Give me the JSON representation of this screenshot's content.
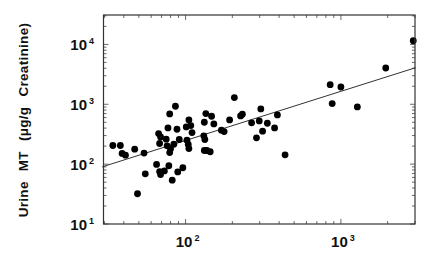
{
  "chart_data": {
    "type": "scatter",
    "title": "",
    "xlabel": "",
    "ylabel": "Urine MT (μg/g Creatinine)",
    "xscale": "log",
    "yscale": "log",
    "xlim": [
      29.6,
      3000
    ],
    "ylim": [
      10,
      31000
    ],
    "grid": false,
    "legend": null,
    "x_ticks": [
      {
        "value": 100,
        "base": "10",
        "exp": "2"
      },
      {
        "value": 1000,
        "base": "10",
        "exp": "3"
      }
    ],
    "y_ticks": [
      {
        "value": 10,
        "base": "10",
        "exp": "1"
      },
      {
        "value": 100,
        "base": "10",
        "exp": "2"
      },
      {
        "value": 1000,
        "base": "10",
        "exp": "3"
      },
      {
        "value": 10000,
        "base": "10",
        "exp": "4"
      }
    ],
    "series": [
      {
        "name": "data",
        "marker": "filled-circle",
        "color": "#000000",
        "points": [
          [
            34,
            205
          ],
          [
            38,
            205
          ],
          [
            39,
            151
          ],
          [
            41,
            141
          ],
          [
            47,
            178
          ],
          [
            49,
            32
          ],
          [
            54,
            153
          ],
          [
            55,
            69
          ],
          [
            65,
            99
          ],
          [
            67,
            324
          ],
          [
            69,
            285
          ],
          [
            68,
            221
          ],
          [
            68,
            75
          ],
          [
            69,
            67
          ],
          [
            73,
            77
          ],
          [
            75,
            261
          ],
          [
            77,
            403
          ],
          [
            76,
            202
          ],
          [
            78,
            94
          ],
          [
            79,
            690
          ],
          [
            80,
            180
          ],
          [
            79,
            156
          ],
          [
            82,
            54
          ],
          [
            84,
            215
          ],
          [
            86,
            926
          ],
          [
            88,
            383
          ],
          [
            89,
            74
          ],
          [
            91,
            258
          ],
          [
            96,
            87
          ],
          [
            101,
            419
          ],
          [
            102,
            251
          ],
          [
            105,
            548
          ],
          [
            104,
            213
          ],
          [
            105,
            182
          ],
          [
            108,
            441
          ],
          [
            110,
            337
          ],
          [
            131,
            297
          ],
          [
            132,
            501
          ],
          [
            133,
            258
          ],
          [
            135,
            699
          ],
          [
            132,
            169
          ],
          [
            137,
            169
          ],
          [
            144,
            161
          ],
          [
            147,
            631
          ],
          [
            152,
            470
          ],
          [
            170,
            369
          ],
          [
            177,
            350
          ],
          [
            192,
            548
          ],
          [
            206,
            1292
          ],
          [
            226,
            639
          ],
          [
            232,
            681
          ],
          [
            266,
            489
          ],
          [
            286,
            275
          ],
          [
            298,
            527
          ],
          [
            305,
            836
          ],
          [
            313,
            355
          ],
          [
            336,
            482
          ],
          [
            374,
            403
          ],
          [
            390,
            664
          ],
          [
            437,
            143
          ],
          [
            853,
            2128
          ],
          [
            879,
            1026
          ],
          [
            1000,
            1944
          ],
          [
            1276,
            903
          ],
          [
            1944,
            4034
          ],
          [
            2924,
            11510
          ]
        ]
      }
    ],
    "regression_line": {
      "color": "#333333",
      "start": [
        29,
        90
      ],
      "end": [
        3027,
        4083
      ],
      "slope_loglog": 0.82
    }
  },
  "axes": {
    "ylabel": "Urine MT (μg/g Creatinine)"
  }
}
